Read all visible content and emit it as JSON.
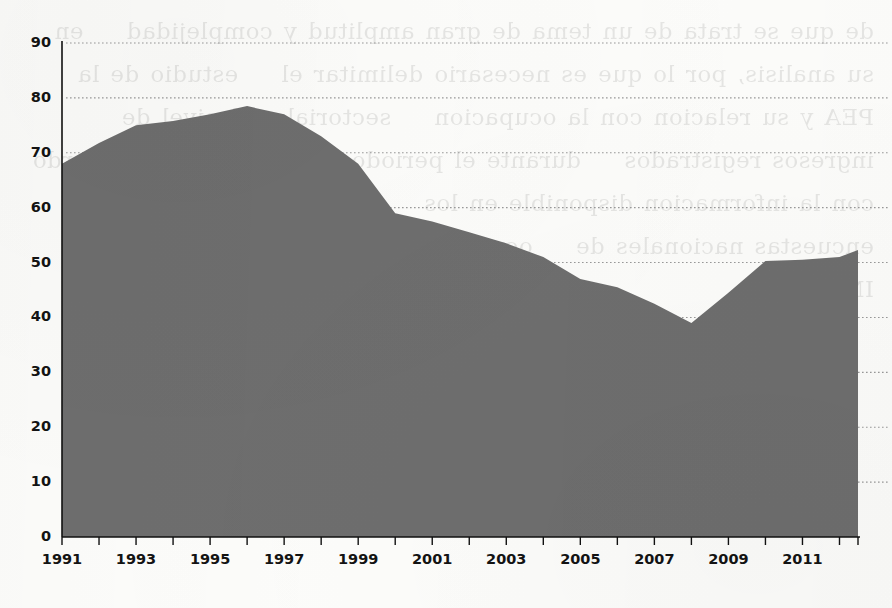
{
  "figure": {
    "background_color": "#fdfdfb",
    "series_color": "#6e6e6e",
    "gridline_color": "#9a9a9a",
    "axis_color": "#111111",
    "bleed_through_text": "de que se trata de un tema de gran amplitud y complejidad    en su analisis, por lo que es necesario delimitar el    estudio de la PEA y su relacion con la ocupacion    sectorial y el nivel de ingresos registrados    durante el periodo de estudio    de acuerdo con la informacion disponible en los    censos economicos y las encuestas nacionales de    ocupacion y empleo levantadas por el INEGI"
  },
  "chart_data": {
    "type": "area",
    "title": "",
    "subtitle": "",
    "xlabel": "",
    "ylabel": "",
    "x": [
      1991,
      1992,
      1993,
      1994,
      1995,
      1996,
      1997,
      1998,
      1999,
      2000,
      2001,
      2002,
      2003,
      2004,
      2005,
      2006,
      2007,
      2008,
      2009,
      2010,
      2011,
      2012
    ],
    "values": [
      68.0,
      71.8,
      75.0,
      75.8,
      77.0,
      78.5,
      77.0,
      73.0,
      68.0,
      59.0,
      57.5,
      55.5,
      53.5,
      51.0,
      47.0,
      45.5,
      42.5,
      39.0,
      44.5,
      50.3,
      50.5,
      51.0
    ],
    "series": [
      {
        "name": "series-1",
        "color": "#6e6e6e",
        "values": [
          68.0,
          71.8,
          75.0,
          75.8,
          77.0,
          78.5,
          77.0,
          73.0,
          68.0,
          59.0,
          57.5,
          55.5,
          53.5,
          51.0,
          47.0,
          45.5,
          42.5,
          39.0,
          44.5,
          50.3,
          50.5,
          51.0
        ]
      }
    ],
    "xlim": [
      1991,
      2012.5
    ],
    "ylim": [
      0,
      90
    ],
    "y_ticks": [
      0,
      10,
      20,
      30,
      40,
      50,
      60,
      70,
      80,
      90
    ],
    "y_tick_labels": [
      "0",
      "10",
      "20",
      "30",
      "40",
      "50",
      "60",
      "70",
      "80",
      "90"
    ],
    "x_ticks": [
      1991,
      1992,
      1993,
      1994,
      1995,
      1996,
      1997,
      1998,
      1999,
      2000,
      2001,
      2002,
      2003,
      2004,
      2005,
      2006,
      2007,
      2008,
      2009,
      2010,
      2011,
      2012
    ],
    "x_tick_labels_shown": [
      {
        "year": 1991,
        "label": "1991"
      },
      {
        "year": 1993,
        "label": "1993"
      },
      {
        "year": 1995,
        "label": "1995"
      },
      {
        "year": 1997,
        "label": "1997"
      },
      {
        "year": 1999,
        "label": "1999"
      },
      {
        "year": 2001,
        "label": "2001"
      },
      {
        "year": 2003,
        "label": "2003"
      },
      {
        "year": 2005,
        "label": "2005"
      },
      {
        "year": 2007,
        "label": "2007"
      },
      {
        "year": 2009,
        "label": "2009"
      },
      {
        "year": 2011,
        "label": "2011"
      }
    ],
    "grid": true,
    "grid_style": "dotted-horizontal",
    "legend": false,
    "legend_position": "none",
    "annotations": []
  }
}
